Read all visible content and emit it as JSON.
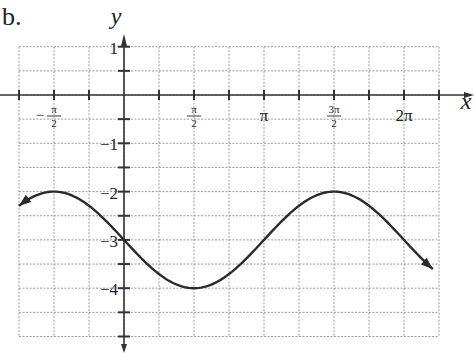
{
  "problem_label": "b.",
  "chart_data": {
    "type": "line",
    "title": "",
    "xlabel": "x",
    "ylabel": "y",
    "function": "y = -3 - sin(x)",
    "x_tick_labels": [
      "−π/2",
      "π/2",
      "π",
      "3π/2",
      "2π"
    ],
    "x_tick_values": [
      -1.5708,
      1.5708,
      3.1416,
      4.7124,
      6.2832
    ],
    "y_tick_labels": [
      "1",
      "−1",
      "−2",
      "−3",
      "−4"
    ],
    "y_tick_values": [
      1,
      -1,
      -2,
      -3,
      -4
    ],
    "xlim": [
      -2.356,
      7.069
    ],
    "ylim": [
      -5,
      1
    ],
    "grid": true,
    "grid_x_step": "π/4",
    "grid_y_step": 0.5,
    "series": [
      {
        "name": "curve",
        "x": [
          -2.356,
          -1.571,
          -0.785,
          0,
          0.785,
          1.571,
          2.356,
          3.142,
          3.927,
          4.712,
          5.498,
          6.283,
          6.9
        ],
        "y": [
          -2.29,
          -2,
          -2.29,
          -3,
          -3.71,
          -4,
          -3.71,
          -3,
          -2.29,
          -2,
          -2.29,
          -3,
          -3.58
        ]
      }
    ],
    "key_points": {
      "maxima": [
        [
          -1.5708,
          -2
        ],
        [
          4.7124,
          -2
        ]
      ],
      "minima": [
        [
          1.5708,
          -4
        ]
      ],
      "midline_crossings": [
        [
          0,
          -3
        ],
        [
          3.1416,
          -3
        ],
        [
          6.2832,
          -3
        ]
      ]
    },
    "arrows": [
      "left-end",
      "right-end"
    ]
  },
  "colors": {
    "curve": "#2a2a2a",
    "axis": "#333333",
    "grid": "#9a9a9a",
    "background": "#ffffff"
  }
}
